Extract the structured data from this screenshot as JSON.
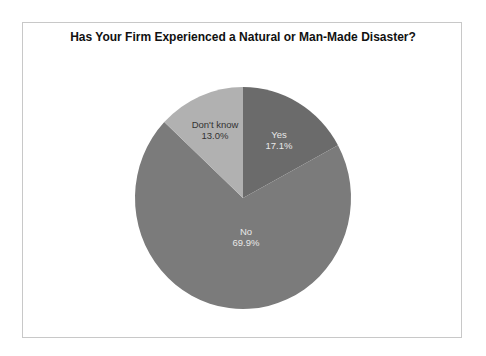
{
  "chart_data": {
    "type": "pie",
    "title": "Has Your Firm Experienced a Natural or Man-Made Disaster?",
    "categories": [
      "Yes",
      "No",
      "Don't know"
    ],
    "values": [
      17.1,
      69.9,
      13.0
    ],
    "labels": [
      "17.1%",
      "69.9%",
      "13.0%"
    ],
    "colors": [
      "#6b6b6b",
      "#7b7b7b",
      "#b1b1b1"
    ],
    "start_angle": "12 o'clock, clockwise",
    "legend": "none (data labels inside slices)"
  }
}
